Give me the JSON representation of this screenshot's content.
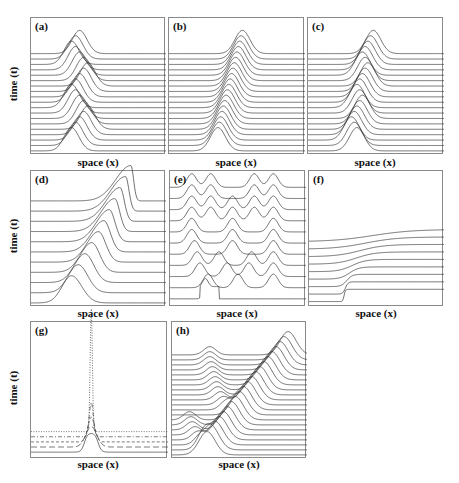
{
  "figure": {
    "ylabel": "time (t)",
    "xlabel": "space (x)"
  },
  "chart_data": [
    {
      "panel": "(a)",
      "type": "line",
      "subtype": "waterfall",
      "xlabel": "space (x)",
      "ylabel": "time (t)",
      "description": "Single Gaussian pulse oscillating back and forth in space over time",
      "n_traces": 19,
      "pulse_centers": [
        0.3,
        0.33,
        0.36,
        0.39,
        0.42,
        0.39,
        0.36,
        0.33,
        0.3,
        0.33,
        0.36,
        0.39,
        0.42,
        0.39,
        0.36,
        0.33,
        0.3,
        0.33,
        0.36
      ],
      "pulse_width": 0.055,
      "pulse_height": 0.17,
      "shape": "gaussian"
    },
    {
      "panel": "(b)",
      "type": "line",
      "subtype": "waterfall",
      "xlabel": "space (x)",
      "description": "Gaussian pulse translating steadily to the right",
      "n_traces": 19,
      "pulse_centers": [
        0.36,
        0.37,
        0.38,
        0.39,
        0.4,
        0.41,
        0.42,
        0.43,
        0.44,
        0.45,
        0.46,
        0.47,
        0.48,
        0.49,
        0.5,
        0.51,
        0.52,
        0.53,
        0.54
      ],
      "pulse_width": 0.055,
      "pulse_height": 0.17,
      "shape": "gaussian"
    },
    {
      "panel": "(c)",
      "type": "line",
      "subtype": "waterfall",
      "xlabel": "space (x)",
      "description": "Gaussian pulse drifting right with oscillation",
      "n_traces": 19,
      "pulse_centers": [
        0.36,
        0.34,
        0.32,
        0.34,
        0.36,
        0.38,
        0.4,
        0.38,
        0.36,
        0.38,
        0.4,
        0.42,
        0.44,
        0.42,
        0.4,
        0.42,
        0.44,
        0.46,
        0.48
      ],
      "pulse_width": 0.055,
      "pulse_height": 0.17,
      "shape": "gaussian"
    },
    {
      "panel": "(d)",
      "type": "line",
      "subtype": "waterfall",
      "xlabel": "space (x)",
      "ylabel": "time (t)",
      "description": "Pulse moving right and steepening into a shock",
      "n_traces": 11,
      "pulse_centers": [
        0.3,
        0.35,
        0.4,
        0.45,
        0.5,
        0.54,
        0.58,
        0.62,
        0.66,
        0.7,
        0.74
      ],
      "pulse_width": 0.07,
      "pulse_height": 0.2,
      "shape": "skewed-steepening"
    },
    {
      "panel": "(e)",
      "type": "line",
      "subtype": "waterfall",
      "xlabel": "space (x)",
      "description": "Initial step evolving into multiple interacting soliton-like peaks",
      "n_traces": 11,
      "peaks_per_trace": [
        [
          0.26
        ],
        [
          0.28,
          0.5,
          0.76
        ],
        [
          0.22,
          0.42,
          0.58,
          0.76
        ],
        [
          0.2,
          0.36,
          0.6,
          0.76
        ],
        [
          0.18,
          0.46,
          0.76
        ],
        [
          0.16,
          0.46,
          0.76
        ],
        [
          0.16,
          0.46,
          0.76
        ],
        [
          0.16,
          0.3,
          0.46,
          0.62,
          0.76
        ],
        [
          0.16,
          0.3,
          0.46,
          0.62,
          0.76
        ],
        [
          0.16,
          0.3,
          0.62,
          0.76
        ],
        [
          0.16,
          0.3,
          0.62,
          0.76
        ]
      ],
      "pulse_width": 0.035,
      "pulse_height": 0.1
    },
    {
      "panel": "(f)",
      "type": "line",
      "subtype": "waterfall",
      "xlabel": "space (x)",
      "description": "Sharp step front progressively smoothing/diffusing over time",
      "n_traces": 9,
      "front_positions": [
        0.26,
        0.27,
        0.28,
        0.3,
        0.32,
        0.35,
        0.38,
        0.42,
        0.47
      ],
      "front_widths": [
        0.005,
        0.01,
        0.02,
        0.035,
        0.05,
        0.07,
        0.09,
        0.12,
        0.15
      ],
      "step_height": 0.09
    },
    {
      "panel": "(g)",
      "type": "line",
      "subtype": "waterfall",
      "xlabel": "space (x)",
      "ylabel": "time (t)",
      "description": "Localized pulse collapsing/focusing into a narrow spike; traces in different dash styles",
      "n_traces": 5,
      "line_styles": [
        "solid",
        "long-dash",
        "short-dash",
        "dash-dot",
        "dotted"
      ],
      "pulse_center": 0.44,
      "pulse_widths": [
        0.08,
        0.04,
        0.025,
        0.015,
        0.008
      ],
      "pulse_heights": [
        0.14,
        0.15,
        0.18,
        0.25,
        0.9
      ]
    },
    {
      "panel": "(h)",
      "type": "line",
      "subtype": "waterfall",
      "xlabel": "space (x)",
      "description": "Large pulse moving right while a smaller pulse emerges, drifts, and re-emerges",
      "n_traces": 21,
      "main_centers": [
        0.26,
        0.29,
        0.32,
        0.35,
        0.38,
        0.41,
        0.44,
        0.47,
        0.5,
        0.53,
        0.56,
        0.59,
        0.62,
        0.65,
        0.68,
        0.71,
        0.74,
        0.77,
        0.8,
        0.83,
        0.86
      ],
      "small_centers": [
        null,
        0.22,
        0.21,
        0.19,
        0.17,
        0.15,
        0.14,
        0.13,
        null,
        0.4,
        0.38,
        0.36,
        0.34,
        0.33,
        0.32,
        0.31,
        0.3,
        0.29,
        0.28,
        0.28,
        0.28
      ],
      "pulse_width": 0.06,
      "pulse_height": 0.17,
      "small_height": 0.06
    }
  ]
}
